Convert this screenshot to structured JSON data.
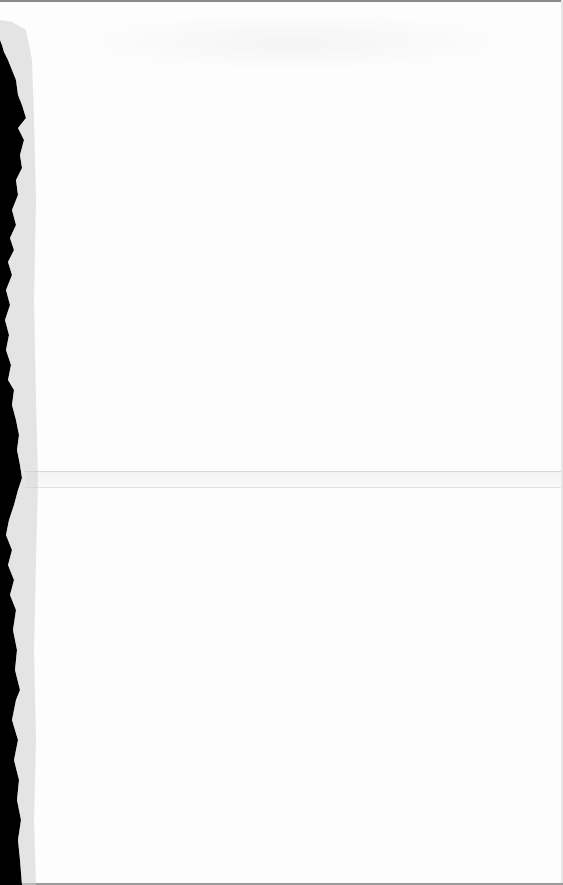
{
  "document": {
    "type": "blank scanned page",
    "text_content": "",
    "colors": {
      "paper": "#fdfdfd",
      "scan_background": "#000000",
      "border": "#8a8a8a",
      "fold_line": "#d9d9d9"
    },
    "features": {
      "torn_left_edge": true,
      "fold_lines_y": [
        471,
        487
      ],
      "faint_bleed_through_top": true
    }
  }
}
